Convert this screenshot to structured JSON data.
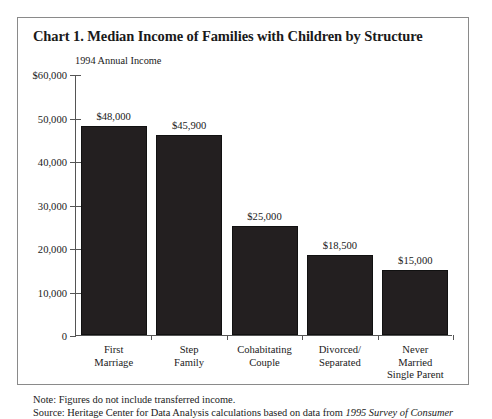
{
  "chart_data": {
    "type": "bar",
    "title": "Chart 1. Median Income of Families with Children by Structure",
    "subtitle": "1994 Annual Income",
    "xlabel": "",
    "ylabel": "",
    "ylim": [
      0,
      60000
    ],
    "grid": false,
    "legend": "none",
    "categories": [
      "First\nMarriage",
      "Step\nFamily",
      "Cohabitating\nCouple",
      "Divorced/\nSeparated",
      "Never\nMarried\nSingle Parent"
    ],
    "category_lines": [
      [
        "First",
        "Marriage"
      ],
      [
        "Step",
        "Family"
      ],
      [
        "Cohabitating",
        "Couple"
      ],
      [
        "Divorced/",
        "Separated"
      ],
      [
        "Never",
        "Married",
        "Single Parent"
      ]
    ],
    "values": [
      48000,
      45900,
      25000,
      18500,
      15000
    ],
    "value_labels": [
      "$48,000",
      "$45,900",
      "$25,000",
      "$18,500",
      "$15,000"
    ],
    "ytick_values": [
      60000,
      50000,
      40000,
      30000,
      20000,
      10000,
      0
    ],
    "ytick_labels": [
      "$60,000",
      "50,000",
      "40,000",
      "30,000",
      "20,000",
      "10,000",
      "0"
    ],
    "bar_color": "#231f20",
    "axis_color": "#555555"
  },
  "footnotes": {
    "note_line": "Note: Figures do not include transferred income.",
    "source_prefix": "Source: Heritage Center for Data Analysis calculations based on data from ",
    "source_italic": "1995 Survey of Consumer"
  }
}
